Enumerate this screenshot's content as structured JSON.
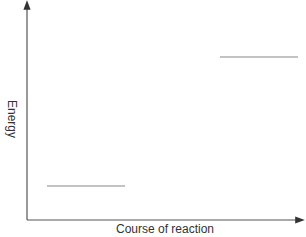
{
  "diagram": {
    "type": "energy-level-diagram",
    "axes": {
      "y_label": "Energy",
      "x_label": "Course of reaction"
    },
    "levels": [
      {
        "name": "lower-level",
        "x1": 47,
        "x2": 125,
        "y": 186
      },
      {
        "name": "upper-level",
        "x1": 220,
        "x2": 298,
        "y": 57
      }
    ],
    "colors": {
      "axis": "#333333",
      "level": "#888888"
    }
  }
}
